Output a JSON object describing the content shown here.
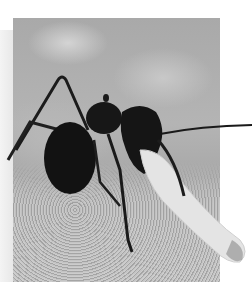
{
  "image": {
    "subject": "ant carrying a larva",
    "style": "grayscale macro photograph",
    "colors": {
      "background": "#ffffff",
      "photo_mid": "#b0b0b0",
      "ant_body": "#141414",
      "larva": "#e6e6e6"
    }
  }
}
